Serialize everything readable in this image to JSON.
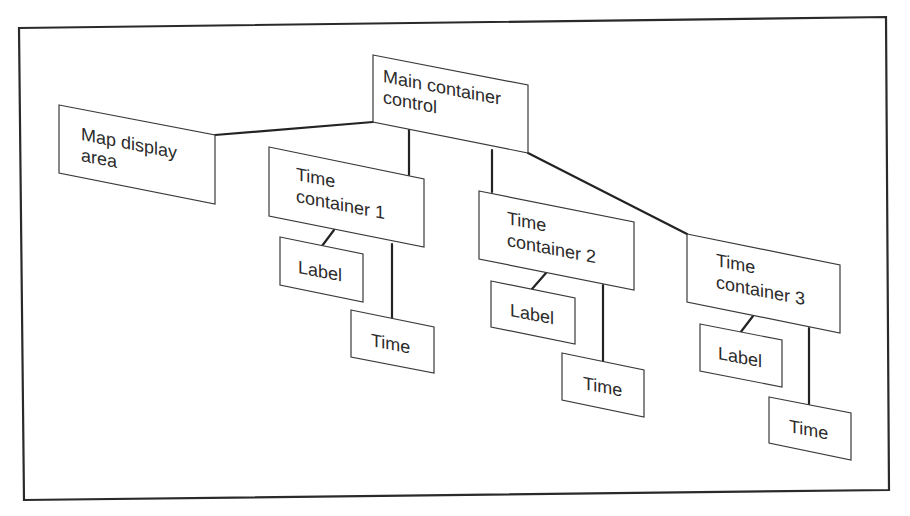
{
  "diagram": {
    "type": "hierarchy",
    "nodes": {
      "main": {
        "line1": "Main container",
        "line2": "control"
      },
      "map": {
        "line1": "Map display",
        "line2": "area"
      },
      "tc1": {
        "line1": "Time",
        "line2": "container 1"
      },
      "tc2": {
        "line1": "Time",
        "line2": "container 2"
      },
      "tc3": {
        "line1": "Time",
        "line2": "container 3"
      },
      "label1": {
        "text": "Label"
      },
      "label2": {
        "text": "Label"
      },
      "label3": {
        "text": "Label"
      },
      "time1": {
        "text": "Time"
      },
      "time2": {
        "text": "Time"
      },
      "time3": {
        "text": "Time"
      }
    },
    "edges": [
      [
        "main",
        "map"
      ],
      [
        "main",
        "tc1"
      ],
      [
        "main",
        "tc2"
      ],
      [
        "main",
        "tc3"
      ],
      [
        "tc1",
        "label1"
      ],
      [
        "tc1",
        "time1"
      ],
      [
        "tc2",
        "label2"
      ],
      [
        "tc2",
        "time2"
      ],
      [
        "tc3",
        "label3"
      ],
      [
        "tc3",
        "time3"
      ]
    ],
    "colors": {
      "stroke": "#2a2a2a",
      "fill": "#ffffff",
      "text": "#2b2b2b"
    }
  }
}
